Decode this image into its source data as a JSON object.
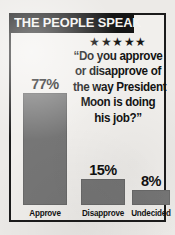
{
  "banner": {
    "title": "THE PEOPLE SPEAK"
  },
  "rating": {
    "stars_icon": "star-rating-five",
    "stars": "★★★★★",
    "count": 5
  },
  "question": {
    "lines": [
      "“Do you approve",
      "or disapprove of",
      "the way President",
      "Moon is doing",
      "his job?”"
    ],
    "full_text": "“Do you approve or disapprove of the way President Moon is doing his job?”"
  },
  "colors": {
    "bar": "#767676",
    "banner_background": "#151515",
    "banner_text": "#f4f3f1",
    "frame_border": "#1b1b1b",
    "paper_background": "#f1efec"
  },
  "chart_data": {
    "type": "bar",
    "title": "THE PEOPLE SPEAK",
    "subtitle": "“Do you approve or disapprove of the way President Moon is doing his job?”",
    "categories": [
      "Approve",
      "Disapprove",
      "Undecided"
    ],
    "values": [
      77,
      15,
      8
    ],
    "value_labels": [
      "77%",
      "15%",
      "8%"
    ],
    "xlabel": "",
    "ylabel": "",
    "ylim": [
      0,
      100
    ],
    "grid": false,
    "legend": "none",
    "units": "percent"
  }
}
